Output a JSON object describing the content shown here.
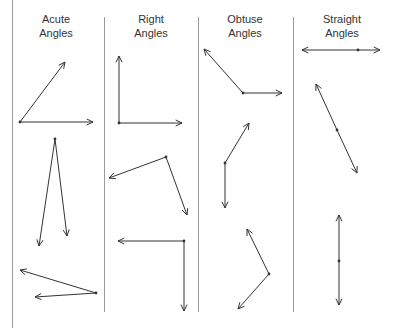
{
  "columns": [
    {
      "title_line1": "Acute",
      "title_line2": "Angles",
      "center_x": 56
    },
    {
      "title_line1": "Right",
      "title_line2": "Angles",
      "center_x": 151
    },
    {
      "title_line1": "Obtuse",
      "title_line2": "Angles",
      "center_x": 245
    },
    {
      "title_line1": "Straight",
      "title_line2": "Angles",
      "center_x": 342
    }
  ],
  "colors": {
    "line": "#333333",
    "divider": "#9a9a9a",
    "text": "#333333"
  },
  "angles": [
    {
      "type": "acute",
      "vertex": [
        20,
        122
      ],
      "rays": [
        [
          65,
          62
        ],
        [
          93,
          122
        ]
      ]
    },
    {
      "type": "acute",
      "vertex": [
        55,
        139
      ],
      "rays": [
        [
          39,
          246
        ],
        [
          67,
          236
        ]
      ]
    },
    {
      "type": "acute",
      "vertex": [
        96,
        293
      ],
      "rays": [
        [
          20,
          270
        ],
        [
          35,
          297
        ]
      ]
    },
    {
      "type": "right",
      "vertex": [
        119,
        123
      ],
      "rays": [
        [
          119,
          56
        ],
        [
          182,
          123
        ]
      ]
    },
    {
      "type": "right",
      "vertex": [
        166,
        157
      ],
      "rays": [
        [
          109,
          178
        ],
        [
          187,
          215
        ]
      ]
    },
    {
      "type": "right",
      "vertex": [
        184,
        241
      ],
      "rays": [
        [
          118,
          241
        ],
        [
          184,
          311
        ]
      ]
    },
    {
      "type": "obtuse",
      "vertex": [
        243,
        93
      ],
      "rays": [
        [
          204,
          49
        ],
        [
          282,
          93
        ]
      ]
    },
    {
      "type": "obtuse",
      "vertex": [
        225,
        163
      ],
      "rays": [
        [
          249,
          123
        ],
        [
          225,
          208
        ]
      ]
    },
    {
      "type": "obtuse",
      "vertex": [
        269,
        274
      ],
      "rays": [
        [
          247,
          229
        ],
        [
          238,
          309
        ]
      ]
    },
    {
      "type": "straight",
      "vertex": [
        358,
        50
      ],
      "rays": [
        [
          302,
          50
        ],
        [
          380,
          50
        ]
      ]
    },
    {
      "type": "straight",
      "vertex": [
        337,
        130
      ],
      "rays": [
        [
          316,
          84
        ],
        [
          357,
          173
        ]
      ]
    },
    {
      "type": "straight",
      "vertex": [
        339,
        261
      ],
      "rays": [
        [
          339,
          215
        ],
        [
          339,
          305
        ]
      ]
    }
  ]
}
